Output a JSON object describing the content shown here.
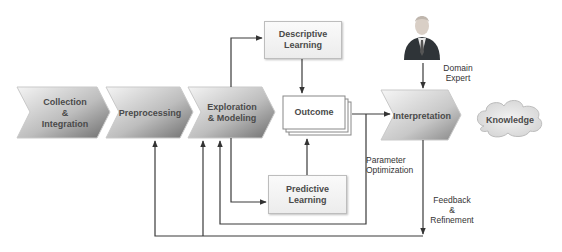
{
  "diagram": {
    "process_steps": [
      {
        "id": "collection",
        "label_lines": [
          "Collection",
          "&",
          "Integration"
        ]
      },
      {
        "id": "preprocessing",
        "label_lines": [
          "Preprocessing"
        ]
      },
      {
        "id": "exploration",
        "label_lines": [
          "Exploration",
          "& Modeling"
        ]
      },
      {
        "id": "interpretation",
        "label_lines": [
          "Interpretation"
        ]
      }
    ],
    "boxes": {
      "descriptive": {
        "line1": "Descriptive",
        "line2": "Learning"
      },
      "predictive": {
        "line1": "Predictive",
        "line2": "Learning"
      },
      "outcome": {
        "label": "Outcome"
      }
    },
    "knowledge": {
      "label": "Knowledge"
    },
    "domain_expert": {
      "line1": "Domain",
      "line2": "Expert",
      "icon": "person-icon"
    },
    "annotations": {
      "parameter_optimization": {
        "line1": "Parameter",
        "line2": "Optimization"
      },
      "feedback_refinement": {
        "line1": "Feedback",
        "line2": "&",
        "line3": "Refinement"
      }
    },
    "colors": {
      "chevron_light": "#f2f2f2",
      "chevron_dark": "#7a7a7a",
      "line": "#3a3a3a",
      "text": "#4a4a4a"
    }
  }
}
